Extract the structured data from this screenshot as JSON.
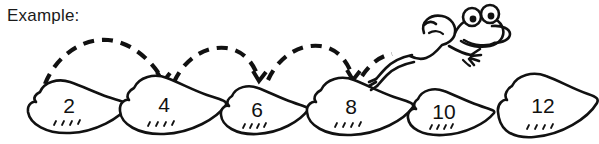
{
  "worksheet": {
    "label": "Example:",
    "background_color": "#ffffff",
    "ink_color": "#111111",
    "width": 599,
    "height": 144
  },
  "diagram": {
    "type": "skip-counting-number-path",
    "pads": [
      {
        "label": "2",
        "cx": 75,
        "cy": 110,
        "w": 100,
        "h": 54,
        "tick_marks": 4
      },
      {
        "label": "4",
        "cx": 168,
        "cy": 108,
        "w": 108,
        "h": 58,
        "tick_marks": 4
      },
      {
        "label": "6",
        "cx": 262,
        "cy": 114,
        "w": 92,
        "h": 48,
        "tick_marks": 4
      },
      {
        "label": "8",
        "cx": 355,
        "cy": 110,
        "w": 108,
        "h": 54,
        "tick_marks": 4
      },
      {
        "label": "10",
        "cx": 447,
        "cy": 116,
        "w": 92,
        "h": 46,
        "tick_marks": 4
      },
      {
        "label": "12",
        "cx": 545,
        "cy": 108,
        "w": 110,
        "h": 60,
        "tick_marks": 4
      }
    ],
    "jump_arcs": [
      {
        "from": "2",
        "to": "4",
        "start_x": 45,
        "peak_x": 103,
        "end_x": 163,
        "peak_y": 42,
        "baseline_y": 80,
        "arrowhead": true
      },
      {
        "from": "4",
        "to": "6",
        "start_x": 172,
        "peak_x": 222,
        "end_x": 258,
        "peak_y": 48,
        "baseline_y": 82,
        "arrowhead": true
      },
      {
        "from": "6",
        "to": "8",
        "start_x": 266,
        "peak_x": 312,
        "end_x": 352,
        "peak_y": 46,
        "baseline_y": 82,
        "arrowhead": true
      },
      {
        "from": "8",
        "to": "10",
        "start_x": 360,
        "peak_x": 382,
        "end_x": 396,
        "peak_y": 55,
        "baseline_y": 78,
        "arrowhead": false
      }
    ],
    "frog": {
      "name": "cartoon-frog",
      "facing": "right",
      "pose": "leaping",
      "eyes": 2
    }
  }
}
